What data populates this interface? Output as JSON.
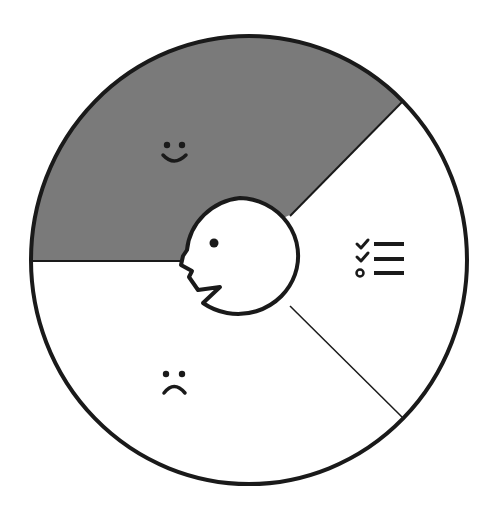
{
  "diagram": {
    "type": "segmented-wheel",
    "colors": {
      "stroke": "#1a1a1a",
      "positive_fill": "#7a7a7a",
      "neutral_fill": "#ffffff",
      "background": "#ffffff"
    },
    "center": {
      "icon": "face-profile-icon",
      "description": "speaking head profile"
    },
    "segments": [
      {
        "id": "positive",
        "icon": "smiley-face-icon",
        "fill": "dark-gray"
      },
      {
        "id": "checklist",
        "icon": "checklist-icon",
        "fill": "white"
      },
      {
        "id": "negative",
        "icon": "frowning-face-icon",
        "fill": "white"
      }
    ]
  }
}
